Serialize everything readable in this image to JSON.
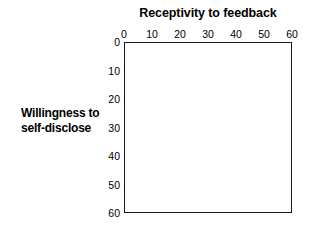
{
  "chart_data": {
    "type": "scatter",
    "title": "Receptivity to feedback",
    "xlabel": "Receptivity to feedback",
    "ylabel": "Willingness to self-disclose",
    "ylabel_lines": [
      "Willingness to",
      "self-disclose"
    ],
    "xlim": [
      0,
      60
    ],
    "ylim": [
      0,
      60
    ],
    "y_axis_inverted": true,
    "grid": false,
    "legend": null,
    "xticks": [
      0,
      10,
      20,
      30,
      40,
      50,
      60
    ],
    "xtick_labels": [
      "0",
      "10",
      "20",
      "30",
      "40",
      "50",
      "60"
    ],
    "yticks": [
      0,
      10,
      20,
      30,
      40,
      50,
      60
    ],
    "ytick_labels": [
      "0",
      "10",
      "20",
      "30",
      "40",
      "50",
      "60"
    ],
    "series": [],
    "values": [],
    "annotations": [],
    "colors": {
      "background": "#ffffff",
      "frame": "#1a1a1a",
      "text": "#000000"
    }
  }
}
